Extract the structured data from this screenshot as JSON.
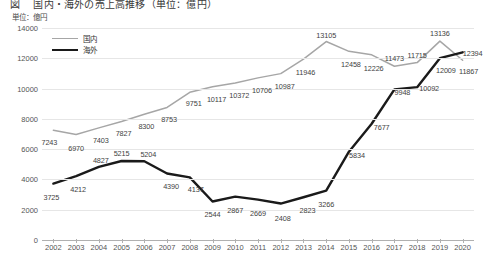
{
  "title": "図　 国内・海外の売上高推移（単位：億円）",
  "unit_label": "単位：億円",
  "legend": {
    "domestic": "国内",
    "overseas": "海外"
  },
  "colors": {
    "domestic": "#a6a6a6",
    "overseas": "#1a1a1a",
    "grid": "#e6e6e6",
    "axis": "#b0b0b0",
    "text": "#555555"
  },
  "chart_data": {
    "type": "line",
    "title": "図　 国内・海外の売上高推移（単位：億円）",
    "xlabel": "",
    "ylabel": "単位：億円",
    "ylim": [
      0,
      14000
    ],
    "yticks": [
      0,
      2000,
      4000,
      6000,
      8000,
      10000,
      12000,
      14000
    ],
    "grid": true,
    "legend_position": "top-left",
    "categories": [
      "2002",
      "2003",
      "2004",
      "2005",
      "2006",
      "2007",
      "2008",
      "2009",
      "2010",
      "2011",
      "2012",
      "2013",
      "2014",
      "2015",
      "2016",
      "2017",
      "2018",
      "2019",
      "2020"
    ],
    "series": [
      {
        "name": "国内",
        "color": "#a6a6a6",
        "values": [
          7243,
          6970,
          7403,
          7827,
          8300,
          8753,
          9751,
          10117,
          10372,
          10706,
          10987,
          11946,
          13105,
          12458,
          12226,
          11473,
          11715,
          13136,
          11867
        ]
      },
      {
        "name": "海外",
        "color": "#1a1a1a",
        "values": [
          3725,
          4212,
          4827,
          5215,
          5204,
          4390,
          4137,
          2544,
          2867,
          2669,
          2408,
          2823,
          3266,
          5834,
          7677,
          9948,
          10092,
          12009,
          12394
        ]
      }
    ]
  }
}
